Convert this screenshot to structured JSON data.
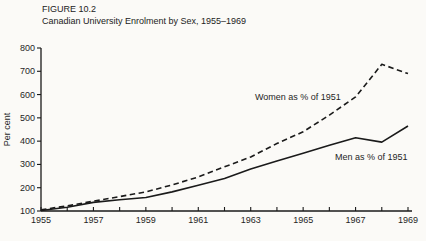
{
  "figure": {
    "label": "FIGURE 10.2",
    "title": "Canadian University Enrolment by Sex, 1955–1969"
  },
  "chart_data": {
    "type": "line",
    "x": [
      1955,
      1956,
      1957,
      1958,
      1959,
      1960,
      1961,
      1962,
      1963,
      1964,
      1965,
      1966,
      1967,
      1968,
      1969
    ],
    "series": [
      {
        "name": "Women as % of 1951",
        "line_style": "dashed",
        "values": [
          105,
          122,
          142,
          162,
          182,
          212,
          246,
          290,
          332,
          390,
          440,
          512,
          590,
          730,
          690
        ]
      },
      {
        "name": "Men as % of 1951",
        "line_style": "solid",
        "values": [
          102,
          116,
          137,
          148,
          158,
          182,
          211,
          240,
          280,
          315,
          348,
          382,
          415,
          396,
          465
        ]
      }
    ],
    "title": "Canadian University Enrolment by Sex, 1955–1969",
    "xlabel": "",
    "ylabel": "Per cent",
    "ylim": [
      100,
      800
    ],
    "yticks": [
      100,
      200,
      300,
      400,
      500,
      600,
      700,
      800
    ],
    "xticks_minor_every_year": true,
    "xtick_labels": [
      "1955",
      "1957",
      "1959",
      "1961",
      "1963",
      "1965",
      "1967",
      "1969"
    ],
    "grid": false,
    "legend_position": "inline-annotations",
    "line_color": "#1a1a1a",
    "background_color": "#fbfaf7",
    "annotations": [
      {
        "text": "Women as % of 1951",
        "x": 1964.8,
        "y": 590
      },
      {
        "text": "Men as % of 1951",
        "x": 1967.6,
        "y": 330
      }
    ]
  }
}
